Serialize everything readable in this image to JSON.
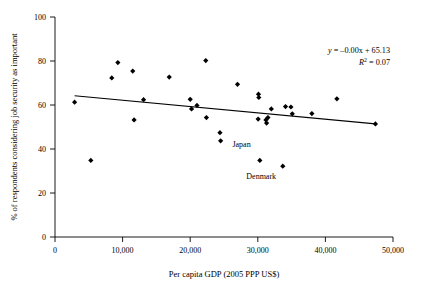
{
  "chart_data": {
    "type": "scatter",
    "title": "",
    "xlabel": "Per capita GDP (2005 PPP US$)",
    "ylabel": "% of respondents considering job security as important",
    "xlim": [
      0,
      50000
    ],
    "ylim": [
      0,
      100
    ],
    "xticks": [
      0,
      10000,
      20000,
      30000,
      40000,
      50000
    ],
    "xticklabels": [
      "0",
      "10,000",
      "20,000",
      "30,000",
      "40,000",
      "50,000"
    ],
    "yticks": [
      0,
      20,
      40,
      60,
      80,
      100
    ],
    "yticklabels": [
      "0",
      "20",
      "40",
      "60",
      "80",
      "100"
    ],
    "grid": false,
    "legend": null,
    "marker": "diamond",
    "marker_color": "#000000",
    "points": [
      {
        "x": 2900,
        "y": 61.3
      },
      {
        "x": 5300,
        "y": 34.8
      },
      {
        "x": 8400,
        "y": 72.3
      },
      {
        "x": 9300,
        "y": 79.3
      },
      {
        "x": 11500,
        "y": 75.4
      },
      {
        "x": 11700,
        "y": 53.2
      },
      {
        "x": 13100,
        "y": 62.4
      },
      {
        "x": 16900,
        "y": 72.7
      },
      {
        "x": 20000,
        "y": 62.6
      },
      {
        "x": 20200,
        "y": 58.2
      },
      {
        "x": 21000,
        "y": 59.8
      },
      {
        "x": 22300,
        "y": 80.2
      },
      {
        "x": 22400,
        "y": 54.3
      },
      {
        "x": 24400,
        "y": 47.4
      },
      {
        "x": 24500,
        "y": 43.7
      },
      {
        "x": 27000,
        "y": 69.4
      },
      {
        "x": 30100,
        "y": 64.9
      },
      {
        "x": 30150,
        "y": 63.4
      },
      {
        "x": 30050,
        "y": 53.6
      },
      {
        "x": 30300,
        "y": 34.8
      },
      {
        "x": 31200,
        "y": 53.2
      },
      {
        "x": 31300,
        "y": 51.8
      },
      {
        "x": 31500,
        "y": 54.3
      },
      {
        "x": 32000,
        "y": 58.2
      },
      {
        "x": 33700,
        "y": 32.2
      },
      {
        "x": 34100,
        "y": 59.3
      },
      {
        "x": 34900,
        "y": 59.1
      },
      {
        "x": 35100,
        "y": 56.0
      },
      {
        "x": 38000,
        "y": 56.1
      },
      {
        "x": 41700,
        "y": 62.8
      },
      {
        "x": 47400,
        "y": 51.4
      }
    ],
    "trendline": {
      "x_start": 2900,
      "y_start": 64.2,
      "x_end": 47400,
      "y_end": 51.4,
      "equation_label": "y = –0.00x + 65.13",
      "r2_label": "R² = 0.07",
      "r2_value": 0.07,
      "slope_label": "–0.00",
      "intercept": 65.13
    },
    "annotations": [
      {
        "label": "Japan",
        "point_x": 30300,
        "point_y": 34.8,
        "text_x": 27600,
        "text_y": 41.0
      },
      {
        "label": "Denmark",
        "point_x": 33700,
        "point_y": 32.2,
        "text_x": 30500,
        "text_y": 26.5
      }
    ]
  },
  "equation": {
    "line1_y": "y",
    "line1_rest": " = –0.00x + 65.13",
    "line2_r": "R",
    "line2_sup": "2",
    "line2_rest": " = 0.07"
  }
}
